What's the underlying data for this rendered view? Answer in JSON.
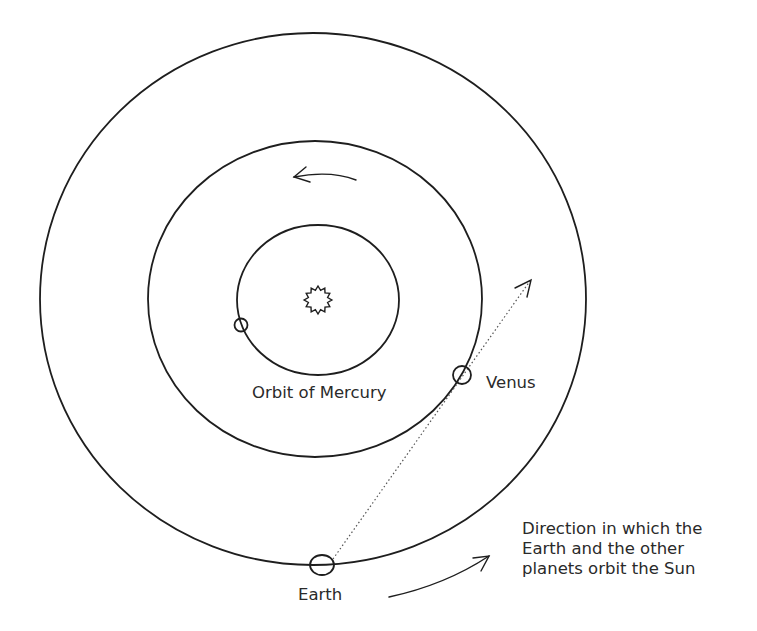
{
  "diagram": {
    "labels": {
      "mercury_orbit": "Orbit of Mercury",
      "venus": "Venus",
      "earth": "Earth",
      "direction_lines": [
        "Direction in which the",
        "Earth and the other",
        "planets orbit the Sun"
      ]
    },
    "bodies": [
      {
        "name": "Sun",
        "icon": "sun-icon"
      },
      {
        "name": "Mercury",
        "icon": "planet-circle"
      },
      {
        "name": "Venus",
        "icon": "planet-circle"
      },
      {
        "name": "Earth",
        "icon": "planet-circle"
      }
    ],
    "orbits": [
      "Mercury",
      "Venus",
      "Earth"
    ],
    "arrows": [
      {
        "name": "orbit-direction-arrow-top",
        "direction": "counter-clockwise"
      },
      {
        "name": "earth-venus-line-of-sight",
        "style": "dotted"
      },
      {
        "name": "orbit-direction-arrow-bottom",
        "direction": "counter-clockwise"
      }
    ],
    "colors": {
      "line": "#1e1e1e",
      "text": "#2a2a2a",
      "background": "#ffffff"
    }
  }
}
